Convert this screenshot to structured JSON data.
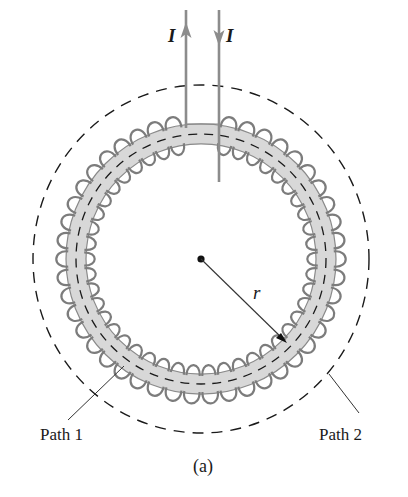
{
  "figure": {
    "caption": "(a)",
    "current_label_up": "I",
    "current_label_down": "I",
    "radius_label": "r",
    "path1_label": "Path 1",
    "path2_label": "Path 2"
  },
  "geometry": {
    "center": [
      201,
      259
    ],
    "toroid_inner_radius": 115,
    "toroid_outer_radius": 135,
    "path1_radius": 125,
    "path2_radius_x": 168,
    "path2_radius_y": 174,
    "coil_turns": 46,
    "wire_left_x": 186,
    "wire_right_x": 219
  },
  "colors": {
    "band_fill": "#d8d8d8",
    "band_edge": "#8a8a8a",
    "coil": "#7c7c7c",
    "wire": "#8c8c8c",
    "ink": "#1a1a1a"
  }
}
